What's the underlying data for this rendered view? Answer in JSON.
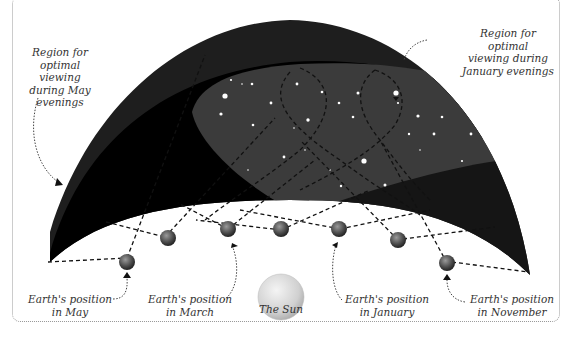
{
  "diagram": {
    "annotations": {
      "may_region": [
        "Region for",
        "optimal viewing",
        "during May",
        "evenings"
      ],
      "january_region": [
        "Region for optimal",
        "viewing during",
        "January evenings"
      ]
    },
    "bodies": {
      "sun": {
        "label": "The Sun",
        "color": "#d8d8d8"
      },
      "earth_positions": [
        {
          "id": "may",
          "label_line1": "Earth's position",
          "label_line2": "in May"
        },
        {
          "id": "april",
          "label_line1": "",
          "label_line2": ""
        },
        {
          "id": "march",
          "label_line1": "Earth's position",
          "label_line2": "in March"
        },
        {
          "id": "february",
          "label_line1": "",
          "label_line2": ""
        },
        {
          "id": "january",
          "label_line1": "Earth's position",
          "label_line2": "in January"
        },
        {
          "id": "december",
          "label_line1": "",
          "label_line2": ""
        },
        {
          "id": "november",
          "label_line1": "Earth's position",
          "label_line2": "in November"
        }
      ]
    },
    "colors": {
      "sky_outer": "#1c1c1c",
      "sky_may_region": "#000000",
      "sky_january_region": "#3a3a3a",
      "ground_wedge": "#6e6e6e",
      "stars": "#ffffff",
      "dashes": "#111111"
    }
  }
}
